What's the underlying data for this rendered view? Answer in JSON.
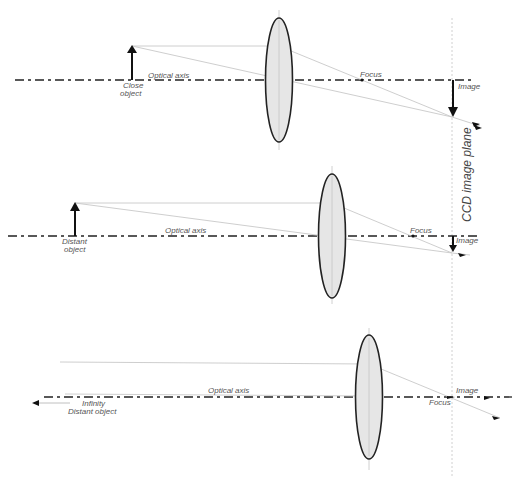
{
  "diagram": {
    "title_vertical": "CCD image plane",
    "colors": {
      "lens_fill": "#e6e6e6",
      "lens_stroke": "#222222",
      "ray": "#c8c8c8",
      "axis": "#222222",
      "text": "#555555"
    },
    "panels": [
      {
        "id": "close",
        "object_label_line1": "Close",
        "object_label_line2": "object",
        "axis_label": "Optical  axis",
        "focus_label": "Focus",
        "image_label": "Image"
      },
      {
        "id": "distant",
        "object_label_line1": "Distant",
        "object_label_line2": "object",
        "axis_label": "Optical  axis",
        "focus_label": "Focus",
        "image_label": "Image"
      },
      {
        "id": "infinity",
        "object_label_line1": "Infinity",
        "object_label_line2": "Distant  object",
        "axis_label": "Optical  axis",
        "focus_label": "Focus",
        "image_label": "Image"
      }
    ]
  }
}
